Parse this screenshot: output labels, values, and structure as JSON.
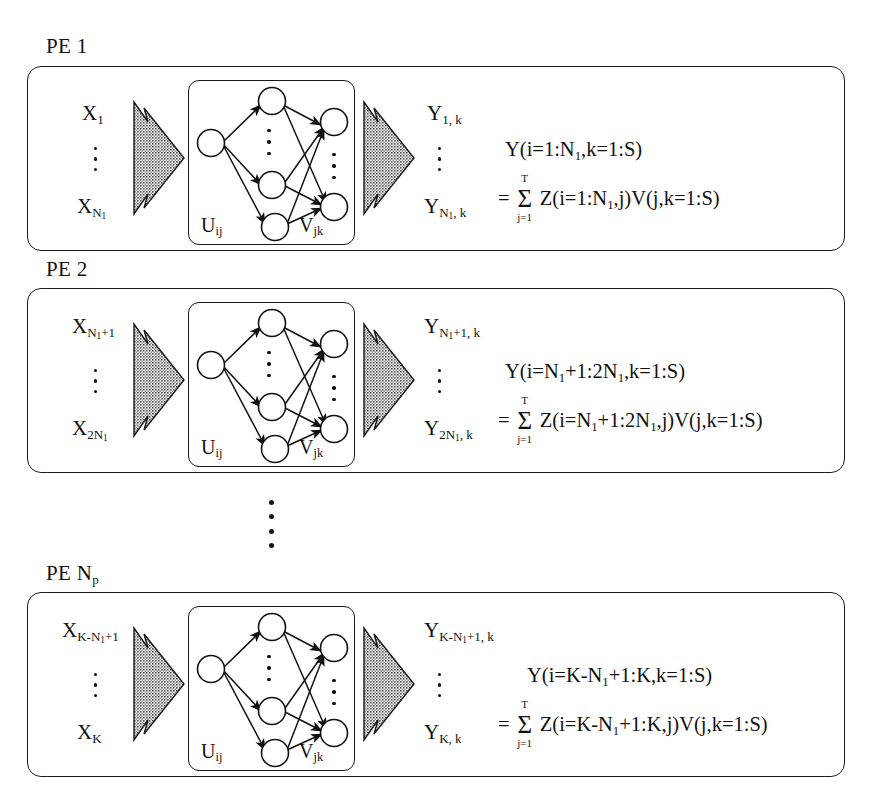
{
  "figure": {
    "type": "block-diagram",
    "panel_count": 3,
    "inner_box_labels": {
      "weights_in": "U",
      "weights_in_sub": "ij",
      "weights_out": "V",
      "weights_out_sub": "jk"
    },
    "ellipsis_dot_counts": {
      "label_dots": 3,
      "network_dots": 3,
      "between_panels_dots": 4
    }
  },
  "panels": [
    {
      "title_prefix": "PE",
      "title_index": "1",
      "title_index_sub": "",
      "input_top": {
        "base": "X",
        "sub": "1"
      },
      "input_bottom": {
        "base": "X",
        "sub": "N",
        "subsub": "1"
      },
      "output_top": {
        "base": "Y",
        "sub": "1, k"
      },
      "output_bottom": {
        "base": "Y",
        "sub": "N",
        "subsub": "1",
        "subtail": ", k"
      },
      "formula_line1": {
        "lhs": "Y(i=1:N",
        "lhs_sub": "1",
        "lhs_tail": ",k=1:S)"
      },
      "formula_line2": {
        "eq": "=",
        "sum_top": "T",
        "sum_bottom": "j=1",
        "rhs": "Z(i=1:N",
        "rhs_sub": "1",
        "rhs_tail": ",j)V(j,k=1:S)"
      }
    },
    {
      "title_prefix": "PE",
      "title_index": "2",
      "title_index_sub": "",
      "input_top": {
        "base": "X",
        "sub": "N",
        "subsub": "1",
        "subtail": "+1"
      },
      "input_bottom": {
        "base": "X",
        "sub": "2N",
        "subsub": "1"
      },
      "output_top": {
        "base": "Y",
        "sub": "N",
        "subsub": "1",
        "subtail": "+1, k"
      },
      "output_bottom": {
        "base": "Y",
        "sub": "2N",
        "subsub": "1",
        "subtail": ", k"
      },
      "formula_line1": {
        "lhs": "Y(i=N",
        "lhs_sub": "1",
        "lhs_tail": "+1:2N",
        "lhs_sub2": "1",
        "lhs_tail2": ",k=1:S)"
      },
      "formula_line2": {
        "eq": "=",
        "sum_top": "T",
        "sum_bottom": "j=1",
        "rhs": "Z(i=N",
        "rhs_sub": "1",
        "rhs_mid": "+1:2N",
        "rhs_sub2": "1",
        "rhs_tail": ",j)V(j,k=1:S)"
      }
    },
    {
      "title_prefix": "PE",
      "title_index": "N",
      "title_index_sub": "p",
      "input_top": {
        "base": "X",
        "sub": "K-N",
        "subsub": "1",
        "subtail": "+1"
      },
      "input_bottom": {
        "base": "X",
        "sub": "K"
      },
      "output_top": {
        "base": "Y",
        "sub": "K-N",
        "subsub": "1",
        "subtail": "+1, k"
      },
      "output_bottom": {
        "base": "Y",
        "sub": "K, k"
      },
      "formula_line1": {
        "lhs": "Y(i=K-N",
        "lhs_sub": "1",
        "lhs_tail": "+1:K,k=1:S)"
      },
      "formula_line2": {
        "eq": "=",
        "sum_top": "T",
        "sum_bottom": "j=1",
        "rhs": "Z(i=K-N",
        "rhs_sub": "1",
        "rhs_tail": "+1:K,j)V(j,k=1:S)"
      }
    }
  ],
  "colors": {
    "stroke": "#1a1a1a",
    "text": "#111111",
    "background": "#ffffff",
    "arrow_fill": "#6e6e6e",
    "arrow_stroke": "#1a1a1a"
  }
}
